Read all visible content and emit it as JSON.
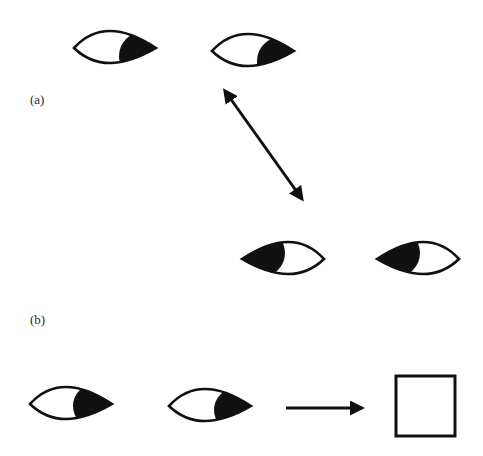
{
  "figure": {
    "colors": {
      "ink": "#111111",
      "background": "#ffffff"
    },
    "panels": [
      {
        "label": "(a)",
        "eyes_top": [
          {
            "gaze": "right-down",
            "cx": 115,
            "cy": 48
          },
          {
            "gaze": "right-down",
            "cx": 253,
            "cy": 51
          }
        ],
        "double_arrow": {
          "from": [
            226,
            93
          ],
          "to": [
            307,
            206
          ],
          "meaning": "alternation"
        },
        "eyes_bottom": [
          {
            "gaze": "left-up",
            "cx": 283,
            "cy": 259
          },
          {
            "gaze": "left-up",
            "cx": 418,
            "cy": 259
          }
        ]
      },
      {
        "label": "(b)",
        "eyes": [
          {
            "gaze": "right",
            "cx": 71,
            "cy": 404
          },
          {
            "gaze": "right",
            "cx": 210,
            "cy": 406
          }
        ],
        "arrow": {
          "from": [
            286,
            408
          ],
          "to": [
            367,
            408
          ]
        },
        "result": "square"
      }
    ]
  }
}
